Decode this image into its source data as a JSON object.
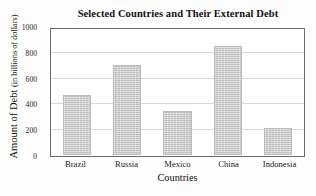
{
  "chart_data": {
    "type": "bar",
    "title": "Selected Countries and Their External Debt",
    "xlabel": "Countries",
    "ylabel": "Amount of Debt",
    "ylabel_units": "(in billions of dollars)",
    "categories": [
      "Brazil",
      "Russia",
      "Mexico",
      "China",
      "Indonesia"
    ],
    "values": [
      470,
      710,
      345,
      855,
      215
    ],
    "ylim": [
      0,
      1000
    ],
    "yticks": [
      0,
      200,
      400,
      600,
      800,
      1000
    ],
    "ytick_labels": [
      "0",
      "200",
      "400",
      "600",
      "800",
      "1000"
    ],
    "grid": true,
    "legend": null,
    "bar_color": "#c9c9c9",
    "frame_color": "#6b6b6b",
    "grid_color": "#d9d9d9"
  }
}
